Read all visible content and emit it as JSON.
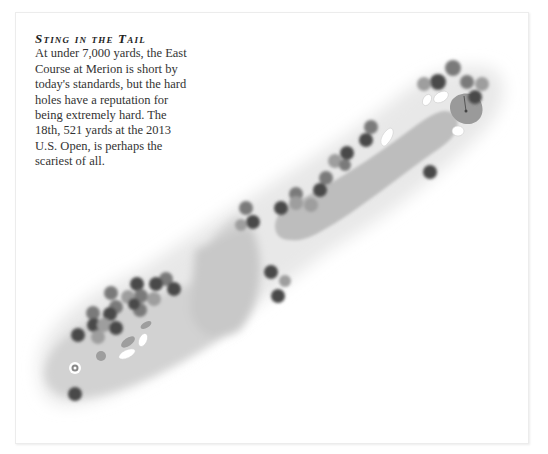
{
  "caption": {
    "title": "Sting in the Tail",
    "body": "At under 7,000 yards, the East Course at Merion is short by today's standards, but the hard holes have a reputation for being extremely hard. The 18th, 521 yards at the 2013 U.S. Open, is perhaps the scariest of all."
  },
  "map": {
    "subject": "18th hole, East Course at Merion",
    "features": [
      "rough",
      "fairway",
      "green",
      "flagstick",
      "bunkers",
      "trees",
      "tee-marker"
    ],
    "colors": {
      "rough": "#e6e6e6",
      "fairway": "#c6c6c6",
      "green": "#9a9a9a",
      "bunker": "#ffffff",
      "tree_dark": "#4a4a4a",
      "tree_mid": "#7a7a7a",
      "tree_light": "#9e9e9e"
    }
  }
}
